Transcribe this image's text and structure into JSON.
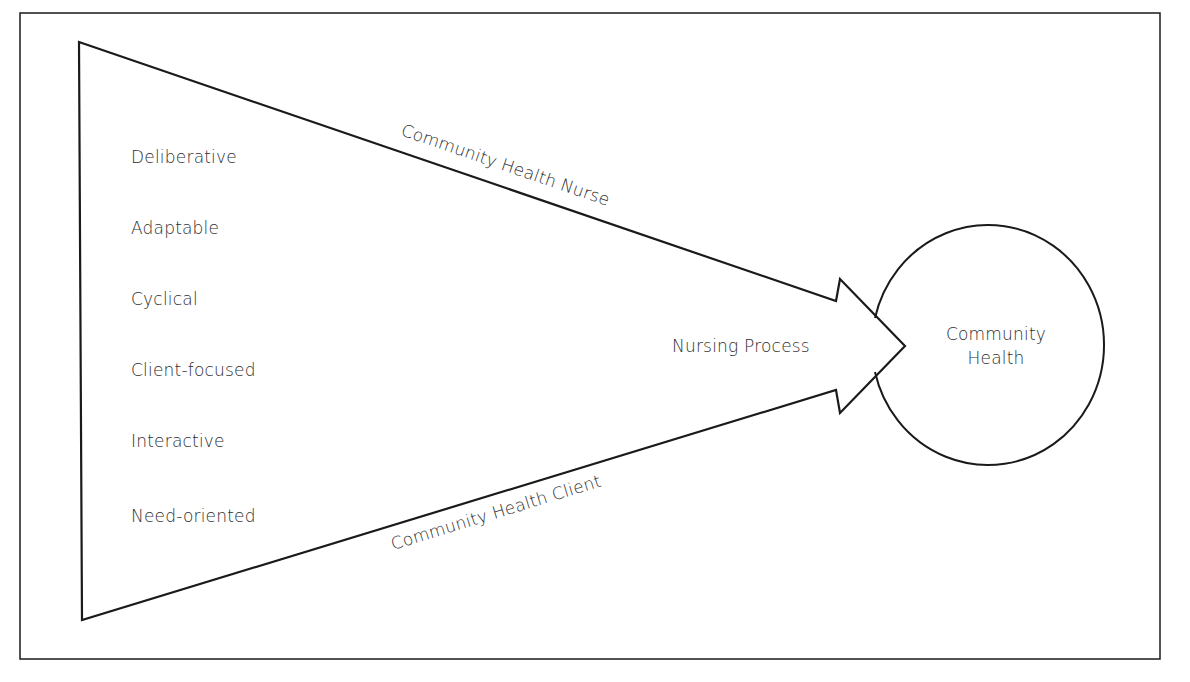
{
  "diagram": {
    "type": "flow-model",
    "attributes": [
      "Deliberative",
      "Adaptable",
      "Cyclical",
      "Client-focused",
      "Interactive",
      "Need-oriented"
    ],
    "top_edge_label": "Community Health Nurse",
    "bottom_edge_label": "Community Health Client",
    "arrow_label": "Nursing Process",
    "target": {
      "line1": "Community",
      "line2": "Health"
    },
    "colors": {
      "stroke": "#1a1a1a",
      "text": "#2e2e2e",
      "background": "#ffffff"
    }
  }
}
